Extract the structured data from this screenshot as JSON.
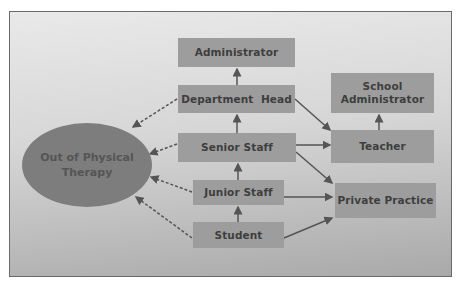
{
  "diagram": {
    "central_node": {
      "label_line1": "Out of Physical",
      "label_line2": "Therapy"
    },
    "nodes": {
      "administrator": "Administrator",
      "department_head": "Department  Head",
      "senior_staff": "Senior Staff",
      "junior_staff": "Junior Staff",
      "student": "Student",
      "school_administrator_line1": "School",
      "school_administrator_line2": "Administrator",
      "teacher": "Teacher",
      "private_practice": "Private Practice"
    },
    "edges": [
      {
        "from": "Department Head",
        "to": "Administrator",
        "style": "solid"
      },
      {
        "from": "Senior Staff",
        "to": "Department Head",
        "style": "solid"
      },
      {
        "from": "Junior Staff",
        "to": "Senior Staff",
        "style": "solid"
      },
      {
        "from": "Student",
        "to": "Junior Staff",
        "style": "solid"
      },
      {
        "from": "Teacher",
        "to": "School Administrator",
        "style": "solid"
      },
      {
        "from": "Department Head",
        "to": "Teacher",
        "style": "solid"
      },
      {
        "from": "Senior Staff",
        "to": "Teacher",
        "style": "solid"
      },
      {
        "from": "Senior Staff",
        "to": "Private Practice",
        "style": "solid"
      },
      {
        "from": "Junior Staff",
        "to": "Private Practice",
        "style": "solid"
      },
      {
        "from": "Student",
        "to": "Private Practice",
        "style": "solid"
      },
      {
        "from": "Department Head",
        "to": "Out of Physical Therapy",
        "style": "dashed"
      },
      {
        "from": "Senior Staff",
        "to": "Out of Physical Therapy",
        "style": "dashed"
      },
      {
        "from": "Junior Staff",
        "to": "Out of Physical Therapy",
        "style": "dashed"
      },
      {
        "from": "Student",
        "to": "Out of Physical Therapy",
        "style": "dashed"
      }
    ]
  }
}
